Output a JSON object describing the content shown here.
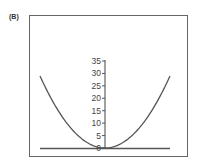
{
  "panel_label": "(B)",
  "chart_data": {
    "type": "line",
    "title": "",
    "xlabel": "",
    "ylabel": "",
    "ylim": [
      0,
      35
    ],
    "xlim": [
      -1,
      1
    ],
    "yticks": [
      0,
      5,
      10,
      15,
      20,
      25,
      30,
      35
    ],
    "ytick_labels": [
      "0",
      "5",
      "10",
      "15",
      "20",
      "25",
      "30",
      "35"
    ],
    "grid": false,
    "legend": null,
    "series": [
      {
        "name": "parabola",
        "x": [
          -1.0,
          -0.8,
          -0.6,
          -0.4,
          -0.2,
          0.0,
          0.2,
          0.4,
          0.6,
          0.8,
          1.0
        ],
        "values": [
          29,
          18.6,
          10.4,
          4.6,
          1.2,
          0,
          1.2,
          4.6,
          10.4,
          18.6,
          29
        ]
      }
    ],
    "colors": {
      "curve": "#555555",
      "axis": "#555555",
      "frame": "#666666"
    }
  }
}
